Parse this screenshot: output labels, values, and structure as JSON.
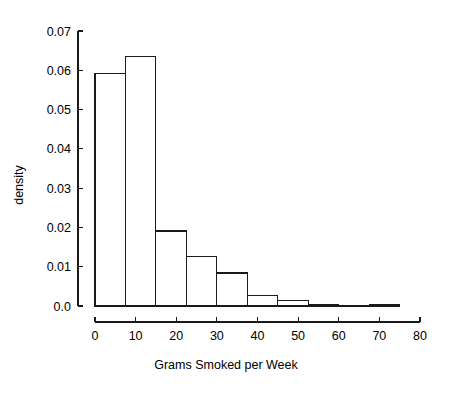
{
  "chart_data": {
    "type": "bar",
    "subtype": "histogram",
    "title": "",
    "xlabel": "Grams Smoked per Week",
    "ylabel": "density",
    "xlim": [
      0,
      80
    ],
    "ylim": [
      0.0,
      0.07
    ],
    "grid": false,
    "legend": null,
    "xticks": [
      0,
      10,
      20,
      30,
      40,
      50,
      60,
      70,
      80
    ],
    "xtick_labels": [
      "0",
      "10",
      "20",
      "30",
      "40",
      "50",
      "60",
      "70",
      "80"
    ],
    "yticks": [
      0.0,
      0.01,
      0.02,
      0.03,
      0.04,
      0.05,
      0.06,
      0.07
    ],
    "ytick_labels": [
      "0.0",
      "0.01",
      "0.02",
      "0.03",
      "0.04",
      "0.05",
      "0.06",
      "0.07"
    ],
    "bin_width": 7.5,
    "bin_edges": [
      0,
      7.5,
      15,
      22.5,
      30,
      37.5,
      45,
      52.5,
      60,
      67.5,
      75
    ],
    "values": [
      0.0592,
      0.0636,
      0.0191,
      0.0127,
      0.0084,
      0.0026,
      0.0013,
      0.0,
      0.0004,
      0.0,
      0.0004
    ],
    "bars": [
      {
        "x0": 0.0,
        "x1": 7.5,
        "density": 0.0592
      },
      {
        "x0": 7.5,
        "x1": 15.0,
        "density": 0.0636
      },
      {
        "x0": 15.0,
        "x1": 22.5,
        "density": 0.0191
      },
      {
        "x0": 22.5,
        "x1": 30.0,
        "density": 0.0127
      },
      {
        "x0": 30.0,
        "x1": 37.5,
        "density": 0.0084
      },
      {
        "x0": 37.5,
        "x1": 45.0,
        "density": 0.0026
      },
      {
        "x0": 45.0,
        "x1": 52.5,
        "density": 0.0013
      },
      {
        "x0": 52.5,
        "x1": 60.0,
        "density": 0.0004
      },
      {
        "x0": 60.0,
        "x1": 67.5,
        "density": 0.0
      },
      {
        "x0": 67.5,
        "x1": 75.0,
        "density": 0.0004
      }
    ],
    "colors": {
      "bar_fill": "#ffffff",
      "bar_stroke": "#1a1a1a",
      "axis": "#1a1a1a",
      "text": "#000000",
      "background": "#ffffff"
    }
  }
}
